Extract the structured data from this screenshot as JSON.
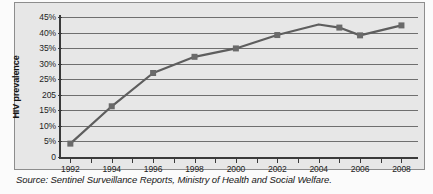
{
  "chart_data": {
    "type": "line",
    "title": "",
    "xlabel": "",
    "ylabel": "HIV prevalence",
    "xlim": [
      1991.5,
      2008.8
    ],
    "ylim": [
      0,
      45
    ],
    "grid": true,
    "legend": null,
    "x": [
      1992,
      1994,
      1996,
      1998,
      2000,
      2002,
      2004,
      2005,
      2006,
      2008
    ],
    "values": [
      4.3,
      16.3,
      27.0,
      32.2,
      34.9,
      39.2,
      42.6,
      41.6,
      39.1,
      42.3
    ],
    "markers": [
      true,
      true,
      true,
      true,
      true,
      true,
      false,
      true,
      true,
      true
    ],
    "series": [
      {
        "name": "HIV prevalence",
        "values": [
          4.3,
          16.3,
          27.0,
          32.2,
          34.9,
          39.2,
          42.6,
          41.6,
          39.1,
          42.3
        ]
      }
    ],
    "y_ticks": [
      0,
      5,
      10,
      15,
      20,
      25,
      30,
      35,
      40,
      45
    ],
    "y_tick_labels": [
      "0",
      "5%",
      "10%",
      "15%",
      "205",
      "25%",
      "30%",
      "35%",
      "40%",
      "45%"
    ],
    "x_ticks": [
      1992,
      1993,
      1994,
      1995,
      1996,
      1997,
      1998,
      1999,
      2000,
      2001,
      2002,
      2003,
      2004,
      2005,
      2006,
      2007,
      2008
    ],
    "x_tick_labels": [
      "1992",
      "1994",
      "1996",
      "1998",
      "2000",
      "2002",
      "2004",
      "2006",
      "2008"
    ],
    "x_labeled_ticks": [
      1992,
      1994,
      1996,
      1998,
      2000,
      2002,
      2004,
      2006,
      2008
    ],
    "series_color": "#5e5e5e",
    "marker_color": "#6a6a6a",
    "gridline_color": "#6f6f6f",
    "axis_color": "#3a3a3a",
    "panel_background": "#e7e7e7"
  },
  "caption": {
    "source_text": "Source: Sentinel Surveillance Reports, Ministry of Health and Social Welfare."
  }
}
